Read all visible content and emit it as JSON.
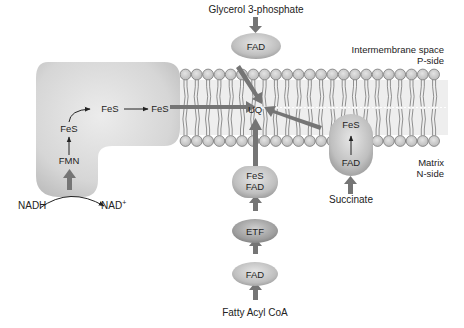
{
  "diagram": {
    "substrates": {
      "glycerol_3_phosphate": "Glycerol 3-phosphate",
      "succinate": "Succinate",
      "fatty_acyl_coa": "Fatty Acyl CoA",
      "nadh": "NADH",
      "nad_plus": "NAD",
      "nad_plus_sup": "+"
    },
    "compartments": {
      "intermembrane_line1": "Intermembrane space",
      "intermembrane_line2": "P-side",
      "matrix_line1": "Matrix",
      "matrix_line2": "N-side"
    },
    "complex_i": {
      "fmn": "FMN",
      "fes_1": "FeS",
      "fes_2": "FeS",
      "fes_3": "FeS"
    },
    "glycerol_dehydrogenase": {
      "fad": "FAD"
    },
    "complex_ii": {
      "fes": "FeS",
      "fad": "FAD"
    },
    "etf_chain": {
      "etf_qo_line1": "FeS",
      "etf_qo_line2": "FAD",
      "etf": "ETF",
      "acyl_coa_dh": "FAD"
    },
    "ubiquinone": "UQ"
  }
}
